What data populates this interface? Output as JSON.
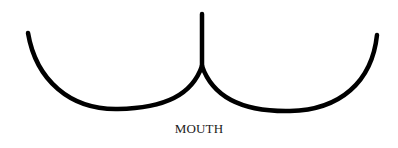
{
  "diagram": {
    "label": "MOUTH",
    "stroke_color": "#000000",
    "background": "#ffffff"
  }
}
